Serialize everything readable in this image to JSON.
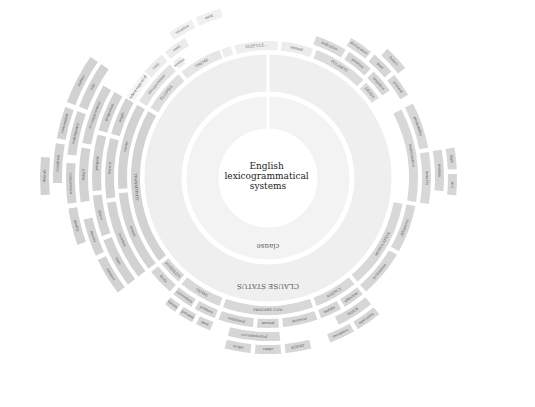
{
  "diagram": {
    "title_lines": [
      "English",
      "lexicogrammatical",
      "systems"
    ],
    "center": {
      "x": 268,
      "y": 178,
      "r": 48
    },
    "colors": {
      "background": "#ffffff",
      "center": "#ffffff",
      "ring1": "#f2f2f2",
      "ring2": "#efefef",
      "outer": "#d2d2d2",
      "outer_light": "#e3e3e3",
      "text": "#555555"
    },
    "rings": [
      {
        "name": "rank",
        "label": "clause",
        "r0": 48,
        "r1": 83,
        "fill": "#f3f3f3"
      },
      {
        "name": "clause-status",
        "label": "CLAUSE STATUS",
        "r0": 85,
        "r1": 125,
        "fill": "#efefef"
      }
    ],
    "segments": [
      {
        "label": "INTERPE...",
        "level": 0,
        "start": -40,
        "end": -15,
        "fill": "#eeeeee"
      },
      {
        "label": "CLEFT.I.E...",
        "level": 0,
        "start": -15,
        "end": 5,
        "fill": "#eeeeee"
      },
      {
        "label": "MOOD TYPE",
        "level": 0,
        "start": 5,
        "end": 20,
        "fill": "#e6e6e6"
      },
      {
        "label": "TOPICAL THEME",
        "level": 1,
        "start": -60,
        "end": -35,
        "fill": "#eeeeee"
      },
      {
        "label": "unmarked topical theme",
        "level": 2,
        "start": -65,
        "end": -45,
        "fill": "#f5f5f5"
      },
      {
        "label": "textual",
        "level": 0,
        "start": 5,
        "end": 20,
        "fill": "#ececec"
      },
      {
        "label": "indicative",
        "level": 1,
        "start": 18,
        "end": 32,
        "fill": "#d9d9d9"
      },
      {
        "label": "declarative",
        "level": 2,
        "start": 30,
        "end": 40,
        "fill": "#d9d9d9"
      },
      {
        "label": "POLARITY",
        "level": 0,
        "start": 20,
        "end": 45,
        "fill": "#dcdcdc"
      },
      {
        "label": "positive",
        "level": 1,
        "start": 32,
        "end": 44,
        "fill": "#d6d6d6"
      },
      {
        "label": "negative",
        "level": 1,
        "start": 44,
        "end": 55,
        "fill": "#d6d6d6"
      },
      {
        "label": "DEIXIS",
        "level": 0,
        "start": 45,
        "end": 55,
        "fill": "#dddddd"
      },
      {
        "label": "past",
        "level": 2,
        "start": 40,
        "end": 50,
        "fill": "#d6d6d6"
      },
      {
        "label": "present",
        "level": 2,
        "start": 50,
        "end": 60,
        "fill": "#d6d6d6"
      },
      {
        "label": "future",
        "level": 3,
        "start": 42,
        "end": 52,
        "fill": "#d6d6d6"
      },
      {
        "label": "modalization",
        "level": 1,
        "start": 62,
        "end": 100,
        "fill": "#d8d8d8"
      },
      {
        "label": "probability",
        "level": 2,
        "start": 62,
        "end": 80,
        "fill": "#d8d8d8"
      },
      {
        "label": "usuality",
        "level": 2,
        "start": 80,
        "end": 100,
        "fill": "#d8d8d8"
      },
      {
        "label": "median",
        "level": 3,
        "start": 80,
        "end": 95,
        "fill": "#d6d6d6"
      },
      {
        "label": "high",
        "level": 4,
        "start": 80,
        "end": 88,
        "fill": "#d6d6d6"
      },
      {
        "label": "low",
        "level": 4,
        "start": 88,
        "end": 96,
        "fill": "#d6d6d6"
      },
      {
        "label": "MODULATION",
        "level": 0,
        "start": 100,
        "end": 140,
        "fill": "#d8d8d8"
      },
      {
        "label": "obligation",
        "level": 1,
        "start": 100,
        "end": 120,
        "fill": "#d6d6d6"
      },
      {
        "label": "inclination",
        "level": 1,
        "start": 120,
        "end": 140,
        "fill": "#d6d6d6"
      },
      {
        "label": "AGENCY",
        "level": 0,
        "start": 140,
        "end": 160,
        "fill": "#d8d8d8"
      },
      {
        "label": "effective",
        "level": 1,
        "start": 140,
        "end": 150,
        "fill": "#d6d6d6"
      },
      {
        "label": "middle",
        "level": 1,
        "start": 150,
        "end": 160,
        "fill": "#d6d6d6"
      },
      {
        "label": "VOICE",
        "level": 2,
        "start": 140,
        "end": 155,
        "fill": "#d6d6d6"
      },
      {
        "label": "operative",
        "level": 3,
        "start": 140,
        "end": 150,
        "fill": "#d6d6d6"
      },
      {
        "label": "receptive",
        "level": 3,
        "start": 150,
        "end": 160,
        "fill": "#d6d6d6"
      },
      {
        "label": "PROCESS TYPE",
        "level": 0,
        "start": 160,
        "end": 200,
        "fill": "#d8d8d8"
      },
      {
        "label": "material",
        "level": 1,
        "start": 160,
        "end": 175,
        "fill": "#d6d6d6"
      },
      {
        "label": "mental",
        "level": 1,
        "start": 175,
        "end": 185,
        "fill": "#d6d6d6"
      },
      {
        "label": "relational",
        "level": 1,
        "start": 185,
        "end": 200,
        "fill": "#d6d6d6"
      },
      {
        "label": "circumstantial",
        "level": 2,
        "start": 175,
        "end": 195,
        "fill": "#d6d6d6"
      },
      {
        "label": "AGENT",
        "level": 3,
        "start": 165,
        "end": 175,
        "fill": "#d6d6d6"
      },
      {
        "label": "range",
        "level": 3,
        "start": 175,
        "end": 185,
        "fill": "#d6d6d6"
      },
      {
        "label": "scope",
        "level": 3,
        "start": 185,
        "end": 195,
        "fill": "#d6d6d6"
      },
      {
        "label": "TENSE",
        "level": 0,
        "start": 200,
        "end": 220,
        "fill": "#d8d8d8"
      },
      {
        "label": "primary",
        "level": 1,
        "start": 200,
        "end": 210,
        "fill": "#d6d6d6"
      },
      {
        "label": "secondary",
        "level": 1,
        "start": 210,
        "end": 220,
        "fill": "#d6d6d6"
      },
      {
        "label": "past",
        "level": 2,
        "start": 200,
        "end": 207,
        "fill": "#d6d6d6"
      },
      {
        "label": "present",
        "level": 2,
        "start": 207,
        "end": 214,
        "fill": "#d6d6d6"
      },
      {
        "label": "future",
        "level": 2,
        "start": 214,
        "end": 220,
        "fill": "#d6d6d6"
      },
      {
        "label": "MODALITY",
        "level": 0,
        "start": 220,
        "end": 232,
        "fill": "#d8d8d8"
      },
      {
        "label": "finite",
        "level": 1,
        "start": 220,
        "end": 232,
        "fill": "#d6d6d6"
      },
      {
        "label": "TRANSITIVITY",
        "level": 0,
        "start": 232,
        "end": 300,
        "fill": "#d2d2d2"
      },
      {
        "label": "extent",
        "level": 1,
        "start": 232,
        "end": 265,
        "fill": "#d2d2d2"
      },
      {
        "label": "location",
        "level": 2,
        "start": 232,
        "end": 262,
        "fill": "#d2d2d2"
      },
      {
        "label": "time",
        "level": 3,
        "start": 232,
        "end": 250,
        "fill": "#d2d2d2"
      },
      {
        "label": "place",
        "level": 3,
        "start": 250,
        "end": 265,
        "fill": "#d2d2d2"
      },
      {
        "label": "manner",
        "level": 4,
        "start": 232,
        "end": 245,
        "fill": "#d2d2d2"
      },
      {
        "label": "means",
        "level": 4,
        "start": 245,
        "end": 258,
        "fill": "#d2d2d2"
      },
      {
        "label": "quality",
        "level": 5,
        "start": 250,
        "end": 262,
        "fill": "#d2d2d2"
      },
      {
        "label": "comparison",
        "level": 5,
        "start": 262,
        "end": 275,
        "fill": "#d2d2d2"
      },
      {
        "label": "cause",
        "level": 1,
        "start": 265,
        "end": 300,
        "fill": "#d2d2d2"
      },
      {
        "label": "reason",
        "level": 2,
        "start": 262,
        "end": 285,
        "fill": "#d2d2d2"
      },
      {
        "label": "purpose",
        "level": 3,
        "start": 265,
        "end": 285,
        "fill": "#d2d2d2"
      },
      {
        "label": "behalf",
        "level": 4,
        "start": 262,
        "end": 280,
        "fill": "#d2d2d2"
      },
      {
        "label": "contingency",
        "level": 5,
        "start": 276,
        "end": 290,
        "fill": "#d2d2d2"
      },
      {
        "label": "condition",
        "level": 6,
        "start": 268,
        "end": 280,
        "fill": "#d2d2d2"
      },
      {
        "label": "concession",
        "level": 6,
        "start": 280,
        "end": 290,
        "fill": "#d2d2d2"
      },
      {
        "label": "default",
        "level": 7,
        "start": 265,
        "end": 276,
        "fill": "#d2d2d2"
      },
      {
        "label": "accompaniment",
        "level": 4,
        "start": 280,
        "end": 300,
        "fill": "#d2d2d2"
      },
      {
        "label": "role",
        "level": 5,
        "start": 290,
        "end": 305,
        "fill": "#d2d2d2"
      },
      {
        "label": "matter",
        "level": 6,
        "start": 290,
        "end": 305,
        "fill": "#d2d2d2"
      },
      {
        "label": "angle",
        "level": 2,
        "start": 285,
        "end": 300,
        "fill": "#d2d2d2"
      },
      {
        "label": "projection",
        "level": 3,
        "start": 285,
        "end": 300,
        "fill": "#d2d2d2"
      },
      {
        "label": "ELLIPSIS",
        "level": 0,
        "start": 300,
        "end": 320,
        "fill": "#dddddd"
      },
      {
        "label": "THEME",
        "level": 0,
        "start": 320,
        "end": 340,
        "fill": "#e6e6e6"
      },
      {
        "label": "interpersonal",
        "level": 1,
        "start": 300,
        "end": 320,
        "fill": "#e2e2e2"
      },
      {
        "label": "textual",
        "level": 1,
        "start": 320,
        "end": 325,
        "fill": "#eeeeee"
      },
      {
        "label": "conj.",
        "level": 2,
        "start": 310,
        "end": 320,
        "fill": "#ececec"
      },
      {
        "label": "cont.",
        "level": 2,
        "start": 320,
        "end": 330,
        "fill": "#ececec"
      },
      {
        "label": "vocative",
        "level": 3,
        "start": 325,
        "end": 335,
        "fill": "#f0f0f0"
      },
      {
        "label": "mod.",
        "level": 3,
        "start": 335,
        "end": 345,
        "fill": "#f0f0f0"
      }
    ],
    "outer_r0": 127,
    "ring_width": 11,
    "ring_gap": 2
  }
}
